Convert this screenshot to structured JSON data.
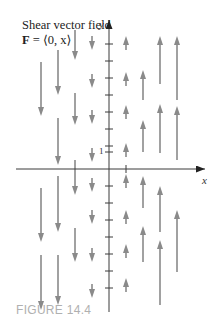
{
  "figure": {
    "title_line1": "Shear vector field",
    "title_bold": "F",
    "title_line2_rest": " = ⟨0, x⟩",
    "caption": "FIGURE 14.4",
    "x_axis_label": "x",
    "y_axis_label": "y",
    "tick_label": "1"
  },
  "colors": {
    "arrow": "#8a8a8a",
    "axis": "#3a3a3a",
    "caption": "#b0b0b0"
  },
  "chart_data": {
    "type": "vector_field",
    "title": "Shear vector field F = ⟨0, x⟩",
    "field": "F(x, y) = ⟨0, x⟩",
    "xlabel": "x",
    "ylabel": "y",
    "tick_labels": [
      "1"
    ],
    "columns_x": [
      -4,
      -3,
      -2,
      -1,
      1,
      2,
      3,
      4
    ]
  },
  "plot": {
    "origin": [
      109,
      169
    ],
    "unit": 17,
    "columns": [
      {
        "x": 41,
        "dir": "down",
        "arrows": [
          [
            62,
            116
          ],
          [
            188,
            242
          ],
          [
            255,
            310
          ]
        ]
      },
      {
        "x": 58,
        "dir": "down",
        "arrows": [
          [
            50,
            95
          ],
          [
            118,
            165
          ],
          [
            176,
            232
          ],
          [
            255,
            305
          ]
        ]
      },
      {
        "x": 75,
        "dir": "down",
        "arrows": [
          [
            30,
            60
          ],
          [
            93,
            125
          ],
          [
            160,
            195
          ],
          [
            228,
            262
          ]
        ]
      },
      {
        "x": 92,
        "dir": "down",
        "arrows": [
          [
            36,
            50
          ],
          [
            74,
            88
          ],
          [
            110,
            124
          ],
          [
            148,
            162
          ],
          [
            178,
            192
          ],
          [
            210,
            224
          ],
          [
            248,
            262
          ],
          [
            284,
            298
          ]
        ]
      },
      {
        "x": 126,
        "dir": "up",
        "arrows": [
          [
            36,
            50
          ],
          [
            72,
            86
          ],
          [
            105,
            119
          ],
          [
            143,
            157
          ],
          [
            174,
            188
          ],
          [
            210,
            224
          ],
          [
            244,
            258
          ],
          [
            278,
            292
          ]
        ]
      },
      {
        "x": 143,
        "dir": "up",
        "arrows": [
          [
            70,
            100
          ],
          [
            120,
            152
          ],
          [
            176,
            208
          ],
          [
            226,
            262
          ]
        ]
      },
      {
        "x": 160,
        "dir": "up",
        "arrows": [
          [
            36,
            84
          ],
          [
            104,
            153
          ],
          [
            186,
            232
          ],
          [
            240,
            305
          ]
        ]
      },
      {
        "x": 177,
        "dir": "up",
        "arrows": [
          [
            36,
            100
          ],
          [
            106,
            160
          ],
          [
            210,
            272
          ]
        ]
      }
    ],
    "y_ticks": [
      44,
      61,
      78,
      95,
      112,
      129,
      146,
      152,
      186,
      203,
      220,
      237,
      254,
      271,
      288
    ]
  }
}
